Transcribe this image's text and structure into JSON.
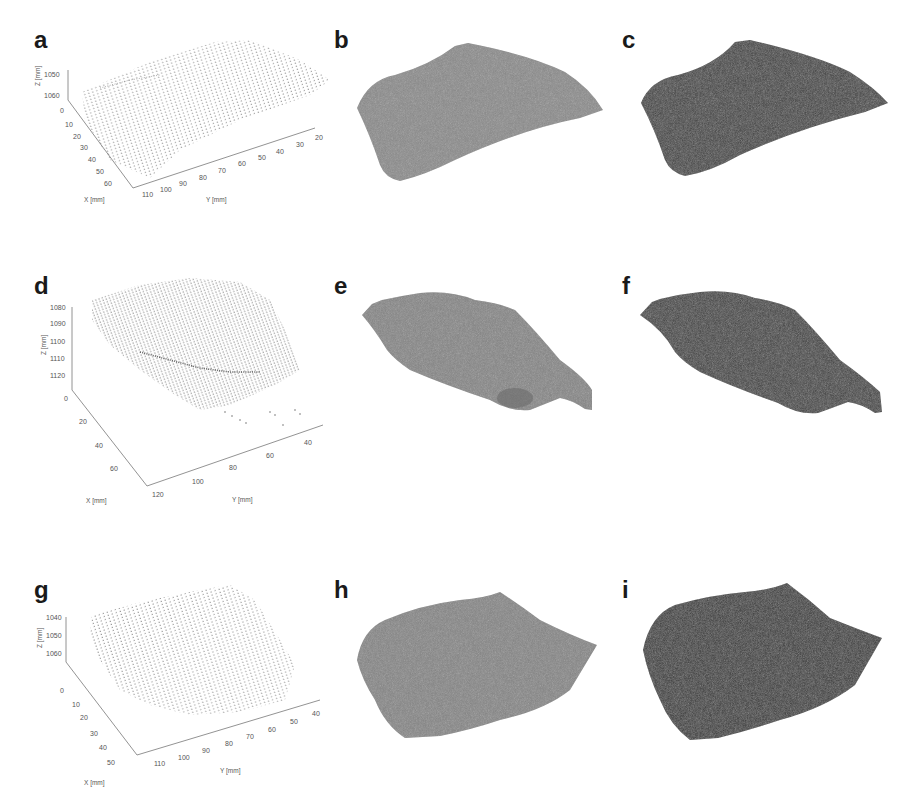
{
  "figure": {
    "panels": [
      {
        "id": "a",
        "label": "a",
        "type": "point-cloud-3d",
        "axes": {
          "z": {
            "label": "Z [mm]",
            "ticks": [
              "1050",
              "1060"
            ]
          },
          "x": {
            "label": "X [mm]",
            "ticks": [
              "0",
              "10",
              "20",
              "30",
              "40",
              "50",
              "60"
            ]
          },
          "y": {
            "label": "Y [mm]",
            "ticks": [
              "110",
              "100",
              "90",
              "80",
              "70",
              "60",
              "50",
              "40",
              "30",
              "20"
            ]
          }
        }
      },
      {
        "id": "b",
        "label": "b",
        "type": "shaded-surface",
        "color": "#8a8a8a"
      },
      {
        "id": "c",
        "label": "c",
        "type": "shaded-surface",
        "color": "#3f3f3f"
      },
      {
        "id": "d",
        "label": "d",
        "type": "point-cloud-3d",
        "axes": {
          "z": {
            "label": "Z [mm]",
            "ticks": [
              "1080",
              "1090",
              "1100",
              "1110",
              "1120"
            ]
          },
          "x": {
            "label": "X [mm]",
            "ticks": [
              "0",
              "20",
              "40",
              "60"
            ]
          },
          "y": {
            "label": "Y [mm]",
            "ticks": [
              "120",
              "100",
              "80",
              "60",
              "40"
            ]
          }
        }
      },
      {
        "id": "e",
        "label": "e",
        "type": "shaded-surface",
        "color": "#858585"
      },
      {
        "id": "f",
        "label": "f",
        "type": "shaded-surface",
        "color": "#404040"
      },
      {
        "id": "g",
        "label": "g",
        "type": "point-cloud-3d",
        "axes": {
          "z": {
            "label": "Z [mm]",
            "ticks": [
              "1040",
              "1050",
              "1060"
            ]
          },
          "x": {
            "label": "X [mm]",
            "ticks": [
              "0",
              "10",
              "20",
              "30",
              "40",
              "50"
            ]
          },
          "y": {
            "label": "Y [mm]",
            "ticks": [
              "110",
              "100",
              "90",
              "80",
              "70",
              "60",
              "50",
              "40"
            ]
          }
        }
      },
      {
        "id": "h",
        "label": "h",
        "type": "shaded-surface",
        "color": "#858585"
      },
      {
        "id": "i",
        "label": "i",
        "type": "shaded-surface",
        "color": "#383838"
      }
    ]
  },
  "colors": {
    "background": "#ffffff",
    "point": "#555555",
    "axis": "#777777",
    "label": "#1a1a1a"
  }
}
